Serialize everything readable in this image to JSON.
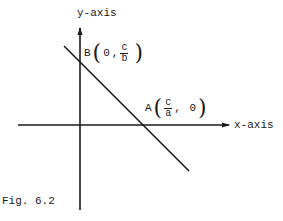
{
  "figure": {
    "caption": "Fig. 6.2",
    "x_axis_label": "x-axis",
    "y_axis_label": "y-axis",
    "points": {
      "B": {
        "name": "B",
        "x": "0",
        "y_num": "c",
        "y_den": "b"
      },
      "A": {
        "name": "A",
        "x_num": "c",
        "x_den": "a",
        "y": "0"
      }
    },
    "colors": {
      "stroke": "#1a1a1a",
      "background": "#ffffff"
    }
  }
}
